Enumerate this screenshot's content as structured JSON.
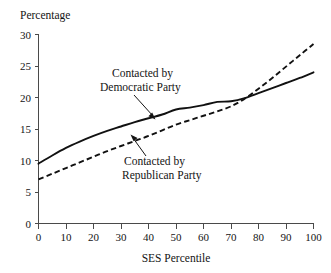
{
  "chart_data": {
    "type": "line",
    "title": "",
    "xlabel": "SES Percentile",
    "ylabel": "Percentage",
    "xlim": [
      0,
      100
    ],
    "ylim": [
      0,
      30
    ],
    "grid": false,
    "legend_position": "inline-annotations",
    "xticks": [
      "0",
      "10",
      "20",
      "30",
      "40",
      "50",
      "60",
      "70",
      "80",
      "90",
      "100"
    ],
    "yticks": [
      "0",
      "5",
      "10",
      "15",
      "20",
      "25",
      "30"
    ],
    "x": [
      0,
      5,
      10,
      15,
      20,
      25,
      30,
      35,
      40,
      45,
      50,
      55,
      60,
      65,
      70,
      75,
      80,
      85,
      90,
      95,
      100
    ],
    "series": [
      {
        "name": "Contacted by Democratic Party",
        "style": "solid",
        "color": "#111111",
        "values": [
          9.5,
          10.8,
          12.0,
          13.0,
          13.9,
          14.7,
          15.4,
          16.1,
          16.7,
          17.3,
          18.1,
          18.4,
          18.8,
          19.3,
          19.4,
          19.9,
          20.7,
          21.5,
          22.3,
          23.1,
          24.0
        ]
      },
      {
        "name": "Contacted by Republican Party",
        "style": "dashed",
        "color": "#111111",
        "values": [
          7.0,
          7.9,
          8.8,
          9.7,
          10.6,
          11.5,
          12.3,
          13.1,
          13.9,
          14.8,
          15.7,
          16.4,
          17.1,
          17.8,
          18.6,
          19.8,
          21.4,
          23.1,
          24.9,
          26.7,
          28.5
        ]
      }
    ],
    "annotations": [
      {
        "id": "democratic",
        "line1": "Contacted by",
        "line2": "Democratic Party",
        "points_to_series": "Contacted by Democratic Party"
      },
      {
        "id": "republican",
        "line1": "Contacted by",
        "line2": "Republican Party",
        "points_to_series": "Contacted by Republican Party"
      }
    ]
  }
}
